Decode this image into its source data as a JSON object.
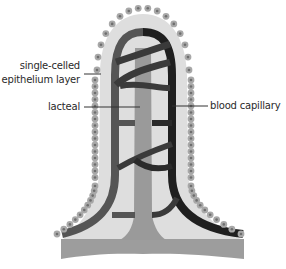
{
  "diagram": {
    "labels": {
      "epithelium_line1": "single-celled",
      "epithelium_line2": "epithelium layer",
      "lacteal": "lacteal",
      "blood_capillary": "blood capillary"
    },
    "colors": {
      "background": "#ffffff",
      "villus_fill": "#dedede",
      "epithelium_cell": "#a8a8a8",
      "epithelium_nucleus": "#6e6e6e",
      "lacteal": "#9a9a9a",
      "capillary_left": "#555555",
      "capillary_right": "#1f1f1f",
      "base": "#9d9d9d",
      "leader_line": "#333333",
      "text": "#2a2a2a"
    }
  }
}
